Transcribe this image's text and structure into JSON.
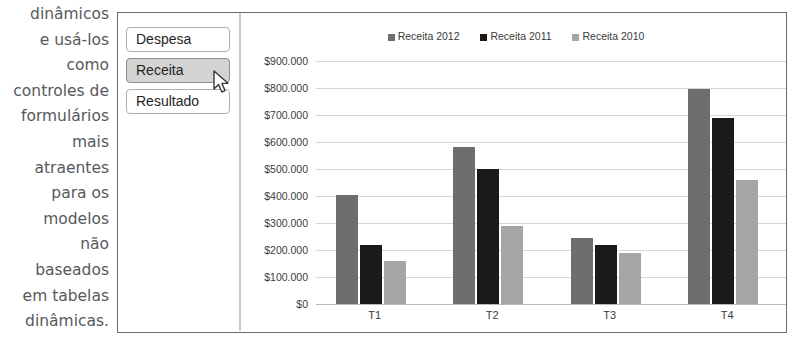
{
  "body_text": {
    "lines": [
      "dinâmicos",
      "e usá-los",
      "como",
      "controles de",
      "formulários",
      "mais",
      "atraentes",
      "para os",
      "modelos",
      "não",
      "baseados",
      "em tabelas",
      "dinâmicas."
    ]
  },
  "buttons": [
    {
      "label": "Despesa",
      "selected": false
    },
    {
      "label": "Receita",
      "selected": true
    },
    {
      "label": "Resultado",
      "selected": false
    }
  ],
  "colors": {
    "series_2012": "#6e6e6e",
    "series_2011": "#1a1a1a",
    "series_2010": "#a6a6a6",
    "panel_border": "#6b6b6b",
    "gridline": "#d6d6d6",
    "button_selected_bg": "#d4d4d4"
  },
  "icons": {
    "cursor": "mouse-pointer-icon"
  },
  "chart_data": {
    "type": "bar",
    "title": "",
    "xlabel": "",
    "ylabel": "",
    "categories": [
      "T1",
      "T2",
      "T3",
      "T4"
    ],
    "series": [
      {
        "name": "Receita 2012",
        "color": "#6e6e6e",
        "values": [
          405000,
          580000,
          245000,
          795000
        ]
      },
      {
        "name": "Receita 2011",
        "color": "#1a1a1a",
        "values": [
          220000,
          500000,
          220000,
          690000
        ]
      },
      {
        "name": "Receita 2010",
        "color": "#a6a6a6",
        "values": [
          160000,
          290000,
          190000,
          460000
        ]
      }
    ],
    "ylim": [
      0,
      900000
    ],
    "ytick_step": 100000,
    "ytick_labels": [
      "$900.000",
      "$800.000",
      "$700.000",
      "$600.000",
      "$500.000",
      "$400.000",
      "$300.000",
      "$200.000",
      "$100.000",
      "$0"
    ],
    "ytick_values": [
      900000,
      800000,
      700000,
      600000,
      500000,
      400000,
      300000,
      200000,
      100000,
      0
    ],
    "grid": true,
    "legend_position": "top"
  }
}
